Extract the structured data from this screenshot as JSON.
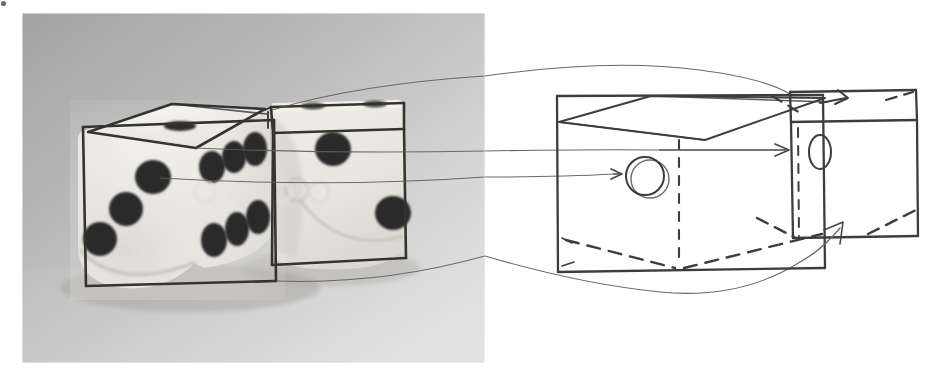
{
  "figure": {
    "title": "Dice photograph with hand-drawn cube wireframe overlay and corresponding line-drawing diagram",
    "panels": [
      {
        "id": "photo-panel",
        "label": "photograph-of-two-dice",
        "x": 22,
        "y": 13,
        "width": 463,
        "height": 350,
        "background_description": "gray gradient studio backdrop, darker at top-left, lighter at bottom-right",
        "background_dark_hex": "#a9a9a9",
        "background_light_hex": "#e2e2e2",
        "surface_hex": "#cfcfcf"
      },
      {
        "id": "diagram-panel",
        "label": "line-drawing-cube-diagram",
        "x": 485,
        "y": 13,
        "width": 455,
        "height": 350,
        "background_hex": "#ffffff"
      }
    ]
  },
  "photo": {
    "dice": [
      {
        "name": "front-die",
        "body_hex": "#f2f0ec",
        "shadow_hex": "#bcb9b4",
        "pip_hex": "#2b2b2b",
        "faces": {
          "top": {
            "name": "top-face",
            "pip_count": 1
          },
          "left": {
            "name": "left-front-face",
            "pip_count": 3
          },
          "right": {
            "name": "right-front-face",
            "pip_count": 6
          }
        }
      },
      {
        "name": "back-die",
        "body_hex": "#efece8",
        "shadow_hex": "#c3bfba",
        "pip_hex": "#2b2b2b",
        "faces": {
          "top": {
            "name": "top-face",
            "pip_count": 2
          },
          "front": {
            "name": "front-face",
            "pip_count": 2
          }
        }
      }
    ],
    "overlay": {
      "name": "hand-drawn-wireframe-overlay",
      "ink_hex": "#33312e",
      "stroke_description": "freehand pencil box outlines traced over each die"
    },
    "watermark": {
      "name": "faint-watermark-text",
      "visible": true,
      "description": "very faint light circular watermark glyphs across the middle of the photograph"
    }
  },
  "diagram": {
    "ink_hex": "#4a4a4a",
    "dark_ink_hex": "#3a3a3a",
    "light_ink_hex": "#8d8d8d",
    "cubes": [
      {
        "name": "left-diagram-cube",
        "label": "front-cube-model",
        "features": [
          {
            "name": "pip-circle-outline",
            "shape": "circle"
          },
          {
            "name": "pip-ellipse-outline",
            "shape": "ellipse"
          },
          {
            "name": "hidden-edge-dashed-vertical",
            "shape": "dashed-line"
          },
          {
            "name": "hidden-edge-dashed-bottom-left",
            "shape": "dashed-line"
          },
          {
            "name": "hidden-edge-dashed-bottom-right",
            "shape": "dashed-line"
          },
          {
            "name": "top-face-parallelogram",
            "shape": "quad"
          }
        ]
      },
      {
        "name": "right-diagram-cube",
        "label": "back-cube-model",
        "features": [
          {
            "name": "top-band-rectangle",
            "shape": "rect"
          },
          {
            "name": "hidden-edge-dashed-vertical",
            "shape": "dashed-line"
          },
          {
            "name": "hidden-edge-dashed-top-left",
            "shape": "dashed-line"
          },
          {
            "name": "hidden-edge-dashed-top-right",
            "shape": "dashed-line"
          },
          {
            "name": "hidden-edge-dashed-bottom-left",
            "shape": "dashed-line"
          },
          {
            "name": "hidden-edge-dashed-bottom-right",
            "shape": "dashed-line"
          }
        ]
      }
    ],
    "arrows": [
      {
        "name": "arrow-to-pip-circle",
        "direction": "right",
        "target": "pip-circle-outline"
      },
      {
        "name": "arrow-to-pip-ellipse",
        "direction": "right",
        "target": "pip-ellipse-outline"
      },
      {
        "name": "arrow-into-top-band",
        "direction": "down-left",
        "target": "top-band-rectangle"
      },
      {
        "name": "curved-arrow-to-bottom-edge",
        "direction": "up-right",
        "target": "right-diagram-cube-bottom-edge"
      }
    ],
    "correspondence_curves": [
      {
        "name": "correspondence-curve-top",
        "from": "photo-back-die-top-corner",
        "to": "diagram-left-cube-top-corner"
      },
      {
        "name": "correspondence-curve-upper-mid",
        "from": "photo-back-die-upper-edge",
        "to": "diagram-left-cube-upper-edge"
      },
      {
        "name": "correspondence-curve-lower-mid",
        "from": "photo-back-die-mid-edge",
        "to": "diagram-left-cube-pip"
      },
      {
        "name": "correspondence-curve-bottom",
        "from": "photo-back-die-bottom-corner",
        "to": "diagram-left-cube-bottom-edge"
      }
    ]
  },
  "marks": {
    "corner_speck": {
      "name": "corner-speck",
      "x": 3,
      "y": 3
    }
  }
}
